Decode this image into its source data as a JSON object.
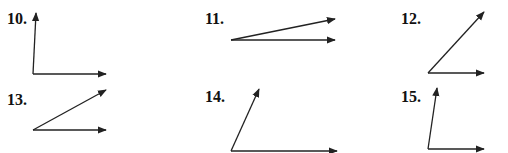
{
  "figures": [
    {
      "label": "10.",
      "label_pos": [
        7,
        11
      ],
      "vertex": [
        33,
        74
      ],
      "rays": [
        [
          36,
          13
        ],
        [
          106,
          74
        ]
      ]
    },
    {
      "label": "11.",
      "label_pos": [
        205,
        11
      ],
      "vertex": [
        231,
        40
      ],
      "rays": [
        [
          335,
          19
        ],
        [
          335,
          40
        ]
      ]
    },
    {
      "label": "12.",
      "label_pos": [
        401,
        11
      ],
      "vertex": [
        428,
        73
      ],
      "rays": [
        [
          484,
          12
        ],
        [
          484,
          73
        ]
      ]
    },
    {
      "label": "13.",
      "label_pos": [
        7,
        92
      ],
      "vertex": [
        33,
        130
      ],
      "rays": [
        [
          106,
          90
        ],
        [
          106,
          130
        ]
      ]
    },
    {
      "label": "14.",
      "label_pos": [
        205,
        89
      ],
      "vertex": [
        231,
        151
      ],
      "rays": [
        [
          259,
          89
        ],
        [
          337,
          151
        ]
      ]
    },
    {
      "label": "15.",
      "label_pos": [
        401,
        89
      ],
      "vertex": [
        428,
        149
      ],
      "rays": [
        [
          437,
          88
        ],
        [
          484,
          149
        ]
      ]
    }
  ],
  "colors": {
    "stroke": "#222222",
    "text": "#111111"
  }
}
